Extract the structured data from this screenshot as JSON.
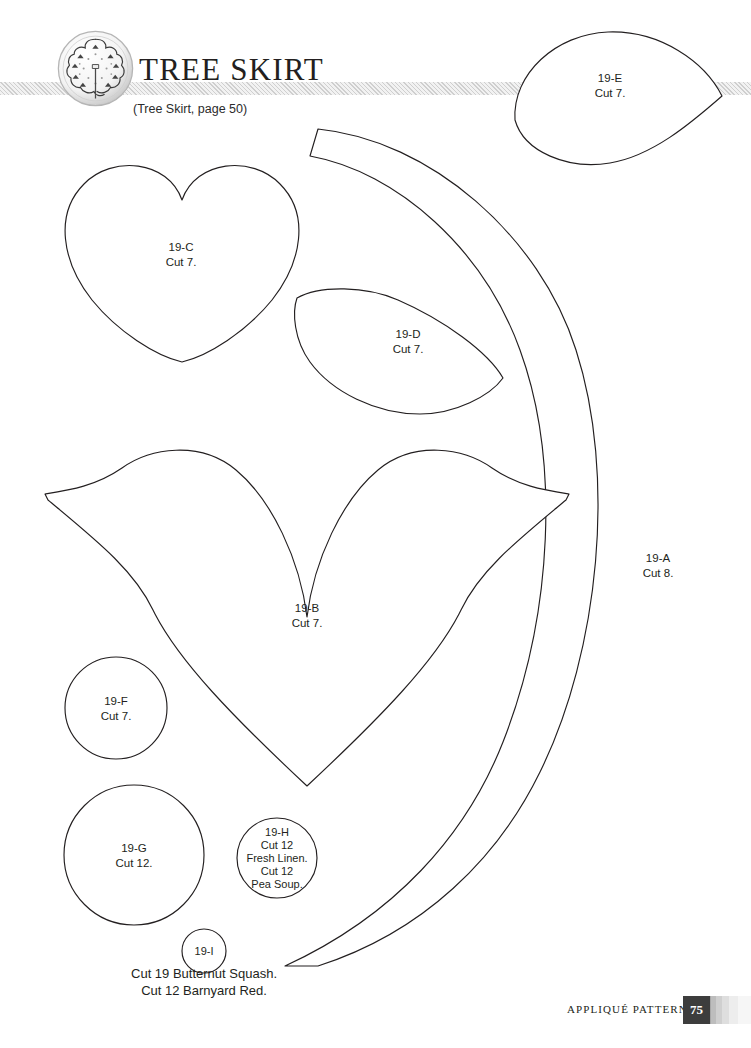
{
  "page": {
    "title": "TREE SKIRT",
    "subtitle": "(Tree Skirt, page 50)",
    "logo_icon": "tree-skirt-circular-logo",
    "background_color": "#ffffff",
    "ink_color": "#231f20",
    "band_color": "#f2f2f2"
  },
  "footer": {
    "section_label": "APPLIQUÉ PATTERNS",
    "page_number": "75",
    "page_number_bg": "#3d3d3d"
  },
  "pieces": [
    {
      "id": "19-A",
      "shape": "crescent-arc",
      "lines": [
        "19-A",
        "Cut 8."
      ],
      "label_x": 658,
      "label_y": 565
    },
    {
      "id": "19-B",
      "shape": "large-winged-heart",
      "lines": [
        "19-B",
        "Cut 7."
      ],
      "label_x": 307,
      "label_y": 615
    },
    {
      "id": "19-C",
      "shape": "heart",
      "lines": [
        "19-C",
        "Cut 7."
      ],
      "label_x": 181,
      "label_y": 254
    },
    {
      "id": "19-D",
      "shape": "leaf",
      "lines": [
        "19-D",
        "Cut 7."
      ],
      "label_x": 408,
      "label_y": 341
    },
    {
      "id": "19-E",
      "shape": "leaf",
      "lines": [
        "19-E",
        "Cut 7."
      ],
      "label_x": 610,
      "label_y": 85
    },
    {
      "id": "19-F",
      "shape": "circle",
      "lines": [
        "19-F",
        "Cut 7."
      ],
      "label_x": 116,
      "label_y": 708
    },
    {
      "id": "19-G",
      "shape": "circle",
      "lines": [
        "19-G",
        "Cut 12."
      ],
      "label_x": 134,
      "label_y": 855
    },
    {
      "id": "19-H",
      "shape": "circle",
      "lines": [
        "19-H",
        "Cut 12",
        "Fresh Linen.",
        "Cut 12",
        "Pea Soup."
      ],
      "label_x": 277,
      "label_y": 858
    },
    {
      "id": "19-I",
      "shape": "circle",
      "lines": [
        "19-I"
      ],
      "label_x": 204,
      "label_y": 951
    }
  ],
  "caption": {
    "line1": "Cut 19 Butternut Squash.",
    "line2": "Cut 12 Barnyard Red."
  }
}
